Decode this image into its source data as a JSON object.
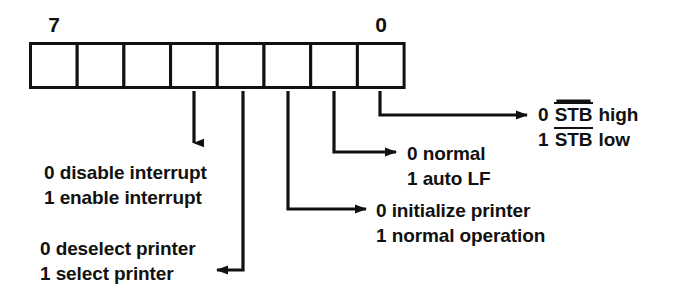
{
  "diagram": {
    "register": {
      "bit_count": 8,
      "left_label": "7",
      "right_label": "0",
      "cells": [
        "",
        "",
        "",
        "",
        "",
        "",
        "",
        ""
      ]
    },
    "ink_color": "#111111",
    "background_color": "#ffffff",
    "annotations": [
      {
        "id": "bit4-interrupt",
        "bit": 4,
        "arrow": "down",
        "lines": [
          "0 disable interrupt",
          "1 enable interrupt"
        ]
      },
      {
        "id": "bit3-select-printer",
        "bit": 3,
        "arrow": "elbow-left",
        "lines": [
          "0 deselect printer",
          "1 select printer"
        ]
      },
      {
        "id": "bit2-initialize-printer",
        "bit": 2,
        "arrow": "elbow-right",
        "lines": [
          "0 initialize printer",
          "1 normal operation"
        ]
      },
      {
        "id": "bit1-auto-lf",
        "bit": 1,
        "arrow": "elbow-right",
        "lines": [
          "0 normal",
          "1 auto LF"
        ]
      },
      {
        "id": "bit0-strobe",
        "bit": 0,
        "arrow": "elbow-right",
        "lines": [
          "0 STB high",
          "1 STB low"
        ],
        "overline_parts": [
          {
            "prefix": "0 ",
            "overlined": "STB",
            "suffix": " high"
          },
          {
            "prefix": "1 ",
            "overlined": "STB",
            "suffix": " low"
          }
        ]
      }
    ]
  }
}
